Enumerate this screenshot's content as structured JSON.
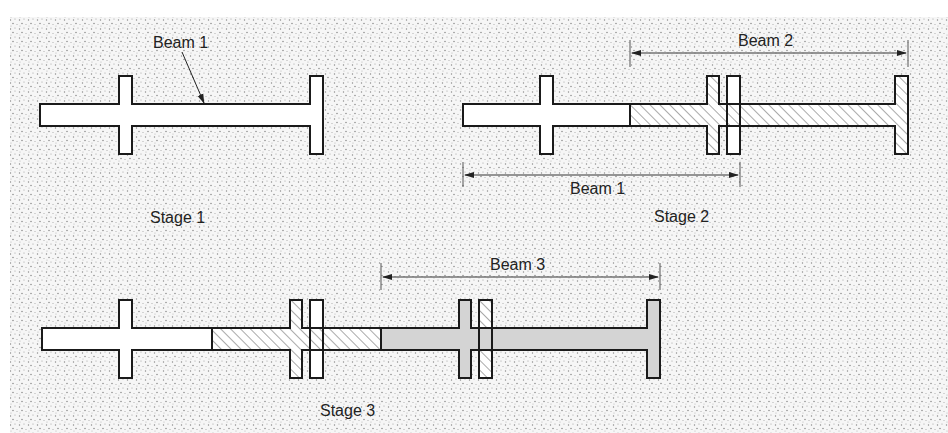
{
  "figure": {
    "background": {
      "fill": "#f4f4f4",
      "stipple_color": "#8a8a8a"
    },
    "legend_fills": {
      "beam1": "#ffffff",
      "beam2": "hatched",
      "beam3": "#d6d6d6"
    },
    "stage1": {
      "caption": "Stage 1",
      "beam_callout": "Beam 1"
    },
    "stage2": {
      "caption": "Stage 2",
      "dimension_top": "Beam 2",
      "dimension_bottom": "Beam 1"
    },
    "stage3": {
      "caption": "Stage 3",
      "dimension_top": "Beam 3"
    }
  },
  "colors": {
    "outline": "#1a1a1a",
    "hatch": "#555555",
    "beam3_fill": "#d4d4d4",
    "dimension_line": "#333333"
  }
}
